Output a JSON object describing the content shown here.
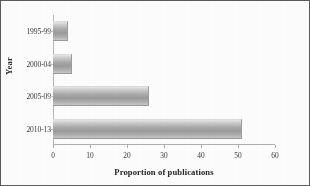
{
  "chart_data": {
    "type": "bar",
    "orientation": "horizontal",
    "title": "",
    "xlabel": "Proportion of publications",
    "ylabel": "Year",
    "categories": [
      "1995-99",
      "2000-04",
      "2005-09",
      "2010-13"
    ],
    "values": [
      4,
      5,
      26,
      51
    ],
    "series": [
      {
        "name": "Proportion of publications",
        "values": [
          4,
          5,
          26,
          51
        ]
      }
    ],
    "xlim": [
      0,
      60
    ],
    "xticks": [
      0,
      10,
      20,
      30,
      40,
      50,
      60
    ],
    "xtick_labels": [
      "0",
      "10",
      "20",
      "30",
      "40",
      "50",
      "60"
    ],
    "grid": false,
    "legend": false,
    "bar_color": "#9b9b9b",
    "background_color": "#fdfdfd",
    "axis_color": "#b0b0b0",
    "text_color": "#2b2b2b"
  }
}
